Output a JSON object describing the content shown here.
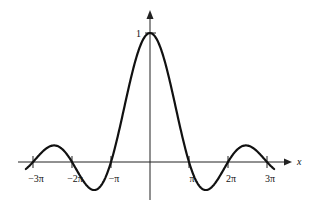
{
  "chart_data": {
    "type": "line",
    "title": "",
    "function": "sin(x)/x",
    "xlabel": "x",
    "ylabel": "",
    "x_ticks": [
      {
        "value": -9.4248,
        "label": "−3π"
      },
      {
        "value": -6.2832,
        "label": "−2π"
      },
      {
        "value": -3.1416,
        "label": "−π"
      },
      {
        "value": 3.1416,
        "label": "π"
      },
      {
        "value": 6.2832,
        "label": "2π"
      },
      {
        "value": 9.4248,
        "label": "3π"
      }
    ],
    "y_ticks": [
      {
        "value": 1,
        "label": "1"
      }
    ],
    "xlim": [
      -10.0,
      10.0
    ],
    "ylim": [
      -0.3,
      1.0
    ],
    "grid": false,
    "legend": null,
    "series": [
      {
        "name": "sinc",
        "x": [
          -10.0,
          -9.4248,
          -7.7253,
          -6.2832,
          -4.4934,
          -3.1416,
          -1.5708,
          0,
          1.5708,
          3.1416,
          4.4934,
          6.2832,
          7.7253,
          9.4248,
          10.0
        ],
        "y": [
          -0.054,
          0,
          0.128,
          0,
          -0.217,
          0,
          0.637,
          1.0,
          0.637,
          0,
          -0.217,
          0,
          0.128,
          0,
          -0.054
        ]
      }
    ]
  },
  "axes": {
    "x_axis_label": "x",
    "y_peak_label": "1"
  }
}
